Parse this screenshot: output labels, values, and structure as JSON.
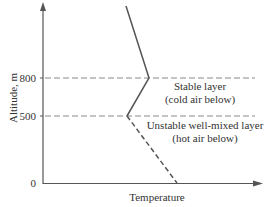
{
  "diagram": {
    "type": "temperature-altitude profile",
    "y_axis": {
      "label": "Altitude, m",
      "ticks": [
        "800",
        "500",
        "0"
      ]
    },
    "x_axis": {
      "label": "Temperature"
    },
    "layers": [
      {
        "line1": "Stable layer",
        "line2": "(cold air below)"
      },
      {
        "line1": "Unstable well-mixed layer",
        "line2": "(hot air below)"
      }
    ],
    "colors": {
      "axis": "#555555",
      "profile": "#555555",
      "boundary": "#888888"
    }
  }
}
